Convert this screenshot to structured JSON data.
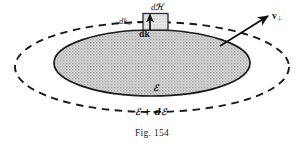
{
  "figure": {
    "caption": "Fig. 154",
    "labels": {
      "area_element": "dℋ",
      "dk_perp_prefix": "dk",
      "dk_perp_sub": "⊥",
      "dk_vector": "dk",
      "velocity_prefix": "v",
      "velocity_sub": "⊥",
      "energy_inner": "ℰ",
      "energy_outer": "ℰ + dℰ"
    },
    "colors": {
      "ink": "#131313",
      "fill_gray": "#c9c9c9",
      "background": "#ffffff",
      "outline": "#1a1a1a"
    },
    "geometry": {
      "outer_ellipse": {
        "cx": 152,
        "cy": 67,
        "rx": 137,
        "ry": 45,
        "style": "dashed"
      },
      "inner_ellipse": {
        "cx": 152,
        "cy": 63,
        "rx": 98,
        "ry": 33,
        "style": "solid-filled"
      },
      "area_element_rect": {
        "x": 143,
        "y": 13,
        "w": 25,
        "h": 17
      },
      "velocity_arrow": {
        "x1": 222,
        "y1": 44,
        "x2": 268,
        "y2": 16
      },
      "dk_arrow": {
        "x1": 152,
        "y1": 31,
        "x2": 152,
        "y2": 14
      }
    }
  }
}
